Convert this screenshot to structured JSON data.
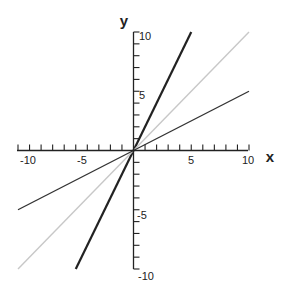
{
  "chart_data": {
    "type": "line",
    "title": "",
    "xlabel": "x",
    "ylabel": "y",
    "xlim": [
      -10,
      10
    ],
    "ylim": [
      -10,
      10
    ],
    "grid": false,
    "legend": null,
    "x_tick_labels": [
      "-10",
      "-5",
      "5",
      "10"
    ],
    "y_tick_labels": [
      "10",
      "5",
      "-5",
      "-10"
    ],
    "x_ticks_every": 1,
    "y_ticks_every": 1,
    "series": [
      {
        "name": "y = 2x",
        "color": "#222222",
        "width": 2.2,
        "x": [
          -5,
          5
        ],
        "y": [
          -10,
          10
        ]
      },
      {
        "name": "y = x",
        "color": "#c8c8c8",
        "width": 1.4,
        "x": [
          -10,
          10
        ],
        "y": [
          -10,
          10
        ]
      },
      {
        "name": "y = 0.5x",
        "color": "#333333",
        "width": 1.4,
        "x": [
          -10,
          10
        ],
        "y": [
          -5,
          5
        ]
      }
    ]
  }
}
